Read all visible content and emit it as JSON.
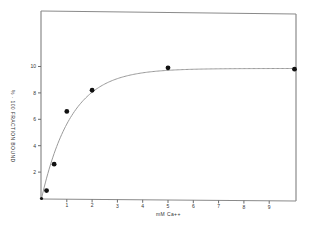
{
  "chart_data": {
    "type": "scatter",
    "title": "",
    "xlabel": "mM Ca++",
    "ylabel": "% · 100 FRACTION BOUND",
    "xlim": [
      0,
      10
    ],
    "ylim": [
      0,
      14
    ],
    "x_ticks": [
      1,
      2,
      3,
      4,
      5,
      6,
      7,
      8,
      9
    ],
    "y_ticks": [
      2,
      4,
      6,
      8,
      10
    ],
    "grid": false,
    "legend": null,
    "series": [
      {
        "name": "data points",
        "type": "scatter",
        "x": [
          0,
          0.2,
          0.5,
          1.0,
          2.0,
          5.0,
          10.0
        ],
        "y": [
          0,
          0.6,
          2.6,
          6.6,
          8.2,
          9.9,
          9.8
        ]
      },
      {
        "name": "fitted curve",
        "type": "line",
        "description": "saturation curve rising from origin to plateau ~9.9",
        "x": [
          0,
          0.5,
          1,
          1.5,
          2,
          3,
          4,
          5,
          6,
          7,
          8,
          9,
          10
        ],
        "y": [
          0,
          3.4,
          5.6,
          7.2,
          8.1,
          9.1,
          9.6,
          9.8,
          9.85,
          9.85,
          9.85,
          9.85,
          9.85
        ]
      }
    ]
  }
}
